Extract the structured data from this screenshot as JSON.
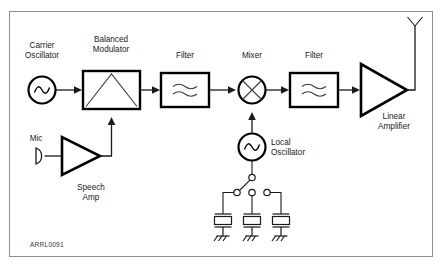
{
  "figure": {
    "tag": "ARRL0091",
    "frame_color": "#8e8e8e",
    "line_color": "#1a1a1a",
    "background": "#ffffff"
  },
  "labels": {
    "carrier_oscillator": "Carrier\nOscillator",
    "carrier_oscillator_line1": "Carrier",
    "carrier_oscillator_line2": "Oscillator",
    "balanced_modulator_line1": "Balanced",
    "balanced_modulator_line2": "Modulator",
    "filter1": "Filter",
    "mixer": "Mixer",
    "filter2": "Filter",
    "linear_amplifier_line1": "Linear",
    "linear_amplifier_line2": "Amplifier",
    "mic": "Mic",
    "speech_amp_line1": "Speech",
    "speech_amp_line2": "Amp",
    "local_oscillator_line1": "Local",
    "local_oscillator_line2": "Oscillator"
  },
  "blocks": [
    {
      "id": "carrier-oscillator",
      "type": "oscillator",
      "label": "Carrier Oscillator"
    },
    {
      "id": "balanced-modulator",
      "type": "block-triangle",
      "label": "Balanced Modulator"
    },
    {
      "id": "filter-1",
      "type": "filter",
      "label": "Filter"
    },
    {
      "id": "mixer",
      "type": "mixer",
      "label": "Mixer"
    },
    {
      "id": "filter-2",
      "type": "filter",
      "label": "Filter"
    },
    {
      "id": "linear-amplifier",
      "type": "amplifier",
      "label": "Linear Amplifier"
    },
    {
      "id": "microphone",
      "type": "mic",
      "label": "Mic"
    },
    {
      "id": "speech-amp",
      "type": "amplifier",
      "label": "Speech Amp"
    },
    {
      "id": "local-oscillator",
      "type": "oscillator",
      "label": "Local Oscillator"
    },
    {
      "id": "crystal-bank",
      "type": "crystal-switch",
      "label": "",
      "crystal_count": 3
    },
    {
      "id": "antenna",
      "type": "antenna",
      "label": ""
    }
  ],
  "signal_path": [
    "Carrier Oscillator",
    "Balanced Modulator",
    "Filter",
    "Mixer",
    "Filter",
    "Linear Amplifier",
    "Antenna"
  ]
}
